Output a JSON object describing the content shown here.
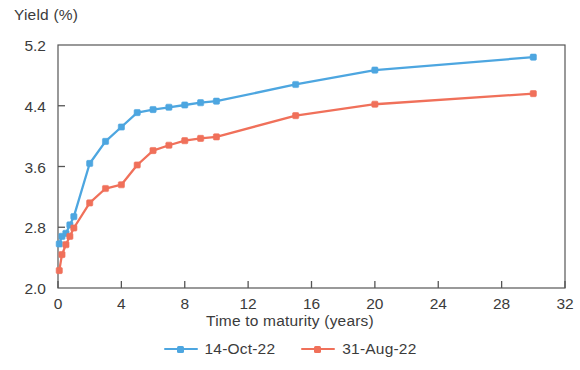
{
  "chart_data": {
    "type": "line",
    "title": "",
    "xlabel": "Time to maturity (years)",
    "ylabel": "Yield (%)",
    "xlim": [
      0,
      32
    ],
    "ylim": [
      2.0,
      5.2
    ],
    "xticks": [
      0,
      4,
      8,
      12,
      16,
      20,
      24,
      28,
      32
    ],
    "yticks": [
      2.0,
      2.8,
      3.6,
      4.4,
      5.2
    ],
    "xtick_labels": [
      "0",
      "4",
      "8",
      "12",
      "16",
      "20",
      "24",
      "28",
      "32"
    ],
    "ytick_labels": [
      "2.0",
      "2.8",
      "3.6",
      "4.4",
      "5.2"
    ],
    "grid": false,
    "legend_position": "bottom",
    "colors": {
      "series_1": "#4DA6E0",
      "series_2": "#F0705A",
      "axis": "#555555",
      "text": "#3b3b3b"
    },
    "x": [
      0.08,
      0.25,
      0.5,
      0.75,
      1,
      2,
      3,
      4,
      5,
      6,
      7,
      8,
      9,
      10,
      15,
      20,
      30
    ],
    "series": [
      {
        "name": "14-Oct-22",
        "color": "#4DA6E0",
        "values": [
          2.58,
          2.68,
          2.72,
          2.83,
          2.94,
          3.64,
          3.93,
          4.12,
          4.31,
          4.35,
          4.38,
          4.41,
          4.44,
          4.46,
          4.68,
          4.87,
          5.04
        ]
      },
      {
        "name": "31-Aug-22",
        "color": "#F0705A",
        "values": [
          2.23,
          2.44,
          2.57,
          2.68,
          2.79,
          3.12,
          3.31,
          3.36,
          3.62,
          3.81,
          3.88,
          3.94,
          3.97,
          3.99,
          4.27,
          4.42,
          4.56
        ]
      }
    ]
  },
  "axes": {
    "y_title": "Yield (%)",
    "x_title": "Time to maturity (years)"
  },
  "legend": {
    "items": [
      {
        "label": "14-Oct-22",
        "color": "#4DA6E0"
      },
      {
        "label": "31-Aug-22",
        "color": "#F0705A"
      }
    ]
  }
}
